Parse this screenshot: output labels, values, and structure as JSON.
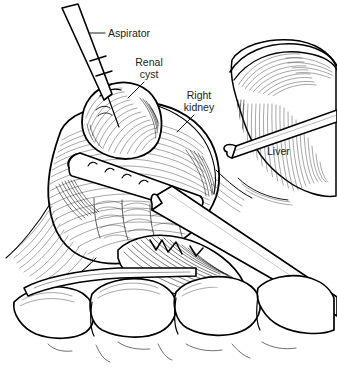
{
  "illustration": {
    "title": "Laparoscopic renal cyst aspiration",
    "background_color": "#ffffff",
    "ink_color": "#000000",
    "text_color": "#1c1c1c",
    "width": 337,
    "height": 372,
    "style": "pen-and-ink medical line drawing with hatching"
  },
  "labels": [
    {
      "id": "aspirator",
      "text": "Aspirator",
      "lines": [
        "Aspirator"
      ],
      "x": 108,
      "y": 37,
      "anchor": "start",
      "leader": {
        "x1": 90,
        "y1": 33,
        "x2": 105,
        "y2": 33
      }
    },
    {
      "id": "renal-cyst",
      "text": "Renal cyst",
      "lines": [
        "Renal",
        "cyst"
      ],
      "x": 149,
      "y": 66,
      "anchor": "middle",
      "leader": {
        "x1": 144,
        "y1": 82,
        "x2": 128,
        "y2": 98
      }
    },
    {
      "id": "right-kidney",
      "text": "Right kidney",
      "lines": [
        "Right",
        "kidney"
      ],
      "x": 199,
      "y": 99,
      "anchor": "middle",
      "leader": {
        "x1": 194,
        "y1": 115,
        "x2": 177,
        "y2": 132
      }
    },
    {
      "id": "liver",
      "text": "Liver",
      "lines": [
        "Liver"
      ],
      "x": 267,
      "y": 155,
      "anchor": "start",
      "leader": null
    }
  ],
  "structures": [
    {
      "id": "renal-cyst",
      "name": "Renal cyst",
      "role": "pale domed bulge on upper kidney pole"
    },
    {
      "id": "right-kidney",
      "name": "Right kidney",
      "role": "central hatched organ mass"
    },
    {
      "id": "liver",
      "name": "Liver",
      "role": "retracted lobe at upper right with vertical hatching"
    },
    {
      "id": "perinephric-fat",
      "name": "Perinephric fat",
      "role": "lobular rounded masses at lower field"
    },
    {
      "id": "fascia",
      "name": "Gerota fascia",
      "role": "streaming fine lines at left and lower left"
    }
  ],
  "instruments": [
    {
      "id": "aspirator",
      "name": "Aspirator",
      "role": "slender needle-tipped cannula entering cyst dome from upper left",
      "has_collar": true
    },
    {
      "id": "fenestrated-cannula",
      "name": "Fenestrated cannula",
      "role": "tube with four side ports lying across kidney",
      "port_count": 4
    },
    {
      "id": "trocar-sheath",
      "name": "Trocar sheath",
      "role": "thick tube crossing field from upper left to lower right"
    },
    {
      "id": "retractor-bar",
      "name": "Retractor",
      "role": "slim bar passing beneath the liver edge"
    },
    {
      "id": "lower-retractor",
      "name": "Lower retractor",
      "role": "thin flat blade at lower left beneath kidney"
    }
  ]
}
